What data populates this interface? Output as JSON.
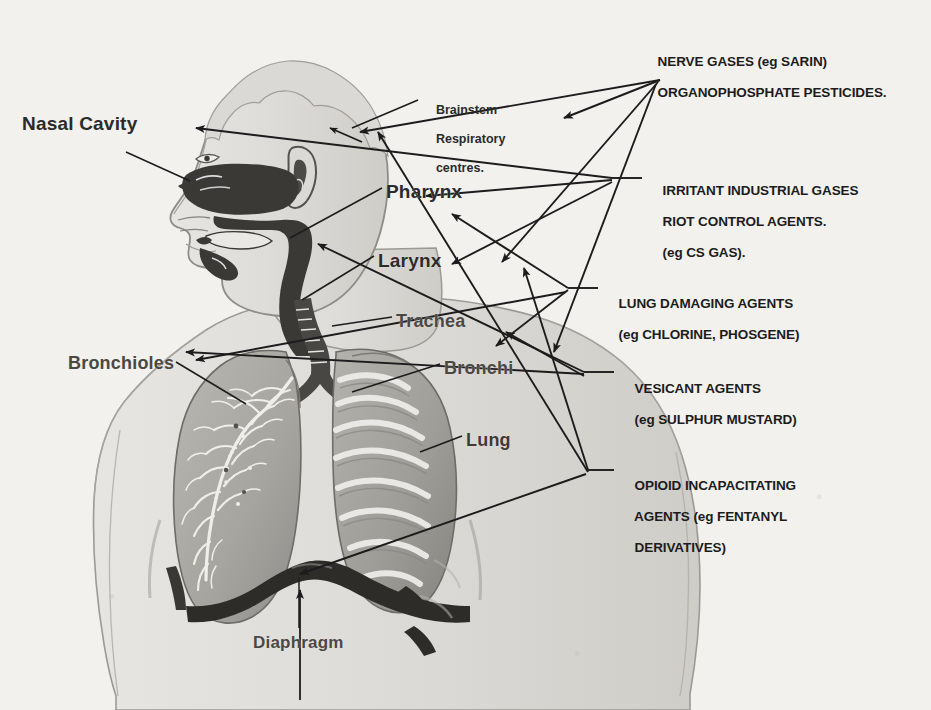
{
  "document": {
    "type": "anatomical-diagram",
    "subject": "Respiratory tract sites of action of chemical warfare agents",
    "background_color": "#f2f1ee",
    "ink_color": "#1c1c1c"
  },
  "anatomy_labels": [
    {
      "id": "nasal-cavity",
      "text": "Nasal Cavity",
      "x": 22,
      "y": 113,
      "size": 19
    },
    {
      "id": "pharynx",
      "text": "Pharynx",
      "x": 386,
      "y": 181,
      "size": 19
    },
    {
      "id": "larynx",
      "text": "Larynx",
      "x": 378,
      "y": 250,
      "size": 19
    },
    {
      "id": "trachea",
      "text": "Trachea",
      "x": 396,
      "y": 311,
      "size": 18
    },
    {
      "id": "bronchioles",
      "text": "Bronchioles",
      "x": 68,
      "y": 353,
      "size": 18
    },
    {
      "id": "bronchi",
      "text": "Bronchi",
      "x": 444,
      "y": 358,
      "size": 18
    },
    {
      "id": "lung",
      "text": "Lung",
      "x": 466,
      "y": 430,
      "size": 18
    },
    {
      "id": "diaphragm",
      "text": "Diaphragm",
      "x": 253,
      "y": 633,
      "size": 17
    }
  ],
  "brainstem_label": {
    "id": "brainstem-respiratory-centres",
    "lines": [
      "Brainstem",
      "Respiratory",
      "centres."
    ],
    "x": 422,
    "y": 88
  },
  "agent_labels": [
    {
      "id": "nerve-gases",
      "lines": [
        "NERVE GASES (eg SARIN)",
        "ORGANOPHOSPHATE PESTICIDES."
      ],
      "x": 643,
      "y": 38
    },
    {
      "id": "irritant-industrial-gases",
      "lines": [
        "IRRITANT INDUSTRIAL GASES",
        "RIOT CONTROL AGENTS.",
        "(eg CS GAS)."
      ],
      "x": 648,
      "y": 167
    },
    {
      "id": "lung-damaging-agents",
      "lines": [
        "LUNG DAMAGING AGENTS",
        "(eg CHLORINE, PHOSGENE)"
      ],
      "x": 604,
      "y": 280
    },
    {
      "id": "vesicant-agents",
      "lines": [
        "VESICANT AGENTS",
        "(eg SULPHUR MUSTARD)"
      ],
      "x": 620,
      "y": 365
    },
    {
      "id": "opioid-incapacitating-agents",
      "lines": [
        "OPIOID INCAPACITATING",
        "AGENTS (eg FENTANYL",
        "DERIVATIVES)"
      ],
      "x": 620,
      "y": 462
    }
  ],
  "leader_lines": {
    "description": "Arrows from agent-class labels to anatomical sites, and plain leaders from anatomy names to structures",
    "count": 16
  },
  "figure": {
    "parts": [
      "head-profile",
      "nasal-cavity-dark",
      "oral-pharyngeal-cavity-dark",
      "ear",
      "neck",
      "shoulders",
      "torso",
      "left-lung-bronchial-tree",
      "right-lung-ribbed",
      "trachea",
      "diaphragm-dark"
    ]
  }
}
